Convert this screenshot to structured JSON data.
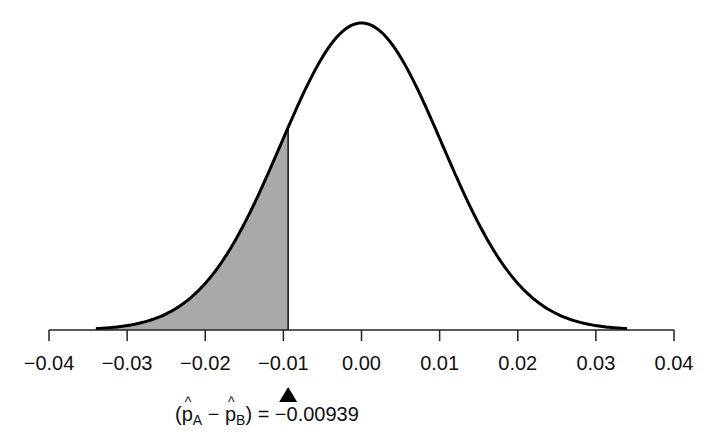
{
  "chart_data": {
    "type": "area",
    "title": "",
    "xlabel": "",
    "ylabel": "",
    "xlim": [
      -0.04,
      0.04
    ],
    "x_ticks": [
      -0.04,
      -0.03,
      -0.02,
      -0.01,
      0.0,
      0.01,
      0.02,
      0.03,
      0.04
    ],
    "x_tick_labels": [
      "−0.04",
      "−0.03",
      "−0.02",
      "−0.01",
      "0.00",
      "0.01",
      "0.02",
      "0.03",
      "0.04"
    ],
    "curve": {
      "distribution": "normal",
      "mean": 0.0,
      "sd": 0.0103,
      "x_range": [
        -0.034,
        0.034
      ]
    },
    "shaded_region": {
      "from": -0.034,
      "to": -0.00939,
      "color": "#a9a9a9"
    },
    "marker": {
      "x": -0.00939,
      "shape": "triangle-up",
      "color": "#000000"
    },
    "annotation": {
      "p_a": "p",
      "sub_a": "A",
      "p_b": "p",
      "sub_b": "B",
      "value_text": "= −0.00939"
    },
    "grid": false,
    "legend": null
  }
}
